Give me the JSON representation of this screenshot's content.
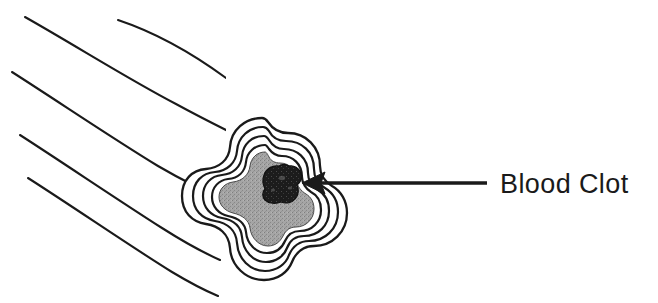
{
  "figure": {
    "background_color": "#ffffff",
    "line_color": "#1a1a1a",
    "lumen_fill_color": "#9a9a9a",
    "clot_fill_color": "#1c1c1c",
    "wall_fill_color": "#ffffff"
  },
  "annotation": {
    "label": "Blood Clot",
    "label_color": "#1a1a1a",
    "pointer": "arrow-left",
    "arrow_tip_x": 302,
    "arrow_tip_y": 183,
    "arrow_tail_x": 487,
    "arrow_tail_y": 183
  },
  "parts": {
    "vessel_tube": "longitudinal blood vessel",
    "vessel_cross_section": "cut end of blood vessel",
    "vessel_wall_layers": "concentric vessel wall rings",
    "lumen": "vessel lumen",
    "clot": "blood clot"
  }
}
